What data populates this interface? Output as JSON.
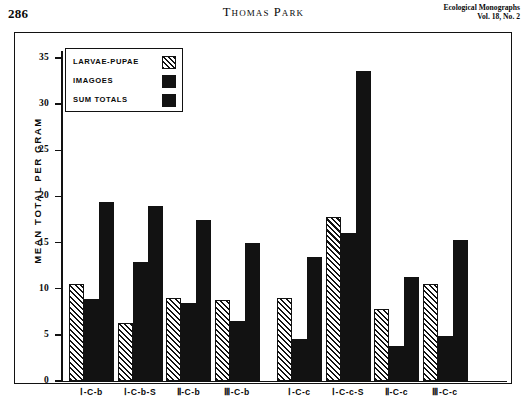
{
  "running_head": {
    "page_number": "286",
    "author": "Thomas Park",
    "journal_line1": "Ecological Monographs",
    "journal_line2": "Vol. 18, No. 2"
  },
  "legend": {
    "items": [
      {
        "label": "LARVAE-PUPAE",
        "swatch": "hatched"
      },
      {
        "label": "IMAGOES",
        "swatch": "solid-black"
      },
      {
        "label": "SUM  TOTALS",
        "swatch": "solid-black"
      }
    ]
  },
  "chart_data": {
    "type": "bar",
    "title": "",
    "xlabel": "",
    "ylabel": "MEAN TOTAL PER GRAM",
    "ylim": [
      0,
      35
    ],
    "yticks": [
      0,
      5,
      10,
      15,
      20,
      25,
      30,
      35
    ],
    "ytick_labels": [
      "0",
      "5",
      "10",
      "15",
      "20",
      "25",
      "30",
      "35"
    ],
    "grid": false,
    "legend_position": "upper-left-inside",
    "categories": [
      "I-C-b",
      "I-C-b-S",
      "II-C-b",
      "III-C-b",
      "I-C-c",
      "I-C-c-S",
      "II-C-c",
      "III-C-c"
    ],
    "series": [
      {
        "name": "LARVAE-PUPAE",
        "fill": "hatched",
        "values": [
          10.5,
          6.3,
          9.0,
          8.8,
          9.0,
          17.8,
          7.8,
          10.5
        ]
      },
      {
        "name": "IMAGOES",
        "fill": "solid-black",
        "values": [
          8.9,
          12.9,
          8.4,
          6.5,
          4.5,
          16.0,
          3.8,
          4.9
        ]
      },
      {
        "name": "SUM TOTALS",
        "fill": "solid-black",
        "values": [
          19.4,
          19.0,
          17.4,
          15.0,
          13.4,
          33.6,
          11.3,
          15.3
        ]
      }
    ]
  }
}
